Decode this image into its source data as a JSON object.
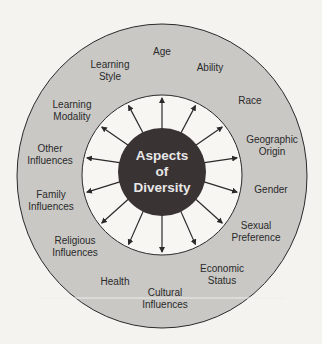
{
  "diagram": {
    "center_label": [
      "Aspects",
      "of",
      "Diversity"
    ],
    "colors": {
      "background": "#f4f3f0",
      "outer_ring": "#c9c8c5",
      "inner_ring": "#f7f6f3",
      "center": "#3a3334",
      "center_text": "#e8e8e8",
      "stroke": "#2a2a2a"
    },
    "aspects": [
      {
        "lines": [
          "Age"
        ],
        "x": 162,
        "y": 52
      },
      {
        "lines": [
          "Ability"
        ],
        "x": 210,
        "y": 68
      },
      {
        "lines": [
          "Race"
        ],
        "x": 250,
        "y": 101
      },
      {
        "lines": [
          "Geographic",
          "Origin"
        ],
        "x": 272,
        "y": 146
      },
      {
        "lines": [
          "Gender"
        ],
        "x": 271,
        "y": 190
      },
      {
        "lines": [
          "Sexual",
          "Preference"
        ],
        "x": 256,
        "y": 232
      },
      {
        "lines": [
          "Economic",
          "Status"
        ],
        "x": 222,
        "y": 275
      },
      {
        "lines": [
          "Cultural",
          "Influences"
        ],
        "x": 165,
        "y": 299
      },
      {
        "lines": [
          "Health"
        ],
        "x": 115,
        "y": 282
      },
      {
        "lines": [
          "Religious",
          "Influences"
        ],
        "x": 75,
        "y": 247
      },
      {
        "lines": [
          "Family",
          "Influences"
        ],
        "x": 51,
        "y": 201
      },
      {
        "lines": [
          "Other",
          "Influences"
        ],
        "x": 50,
        "y": 155
      },
      {
        "lines": [
          "Learning",
          "Modality"
        ],
        "x": 72,
        "y": 111
      },
      {
        "lines": [
          "Learning",
          "Style"
        ],
        "x": 110,
        "y": 71
      }
    ],
    "arrow_count": 14
  }
}
